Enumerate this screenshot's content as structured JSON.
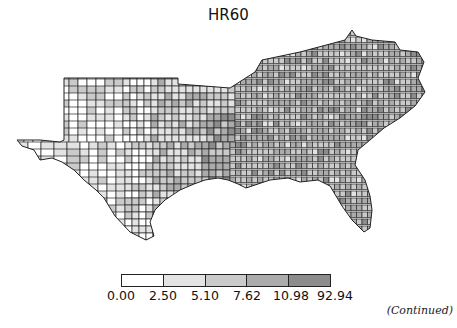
{
  "title": "HR60",
  "map": {
    "region": "Southern United States counties",
    "variable": "HR60",
    "classification": "quantile",
    "region_groups": [
      {
        "name": "texas-west",
        "mean_class": 1
      },
      {
        "name": "texas-east",
        "mean_class": 2
      },
      {
        "name": "oklahoma",
        "mean_class": 1
      },
      {
        "name": "arkansas-louisiana",
        "mean_class": 3
      },
      {
        "name": "mississippi-alabama",
        "mean_class": 3
      },
      {
        "name": "tennessee-kentucky",
        "mean_class": 3
      },
      {
        "name": "georgia-carolinas",
        "mean_class": 3
      },
      {
        "name": "virginia-maryland",
        "mean_class": 3
      },
      {
        "name": "florida",
        "mean_class": 3
      }
    ]
  },
  "legend": {
    "breaks": [
      "0.00",
      "2.50",
      "5.10",
      "7.62",
      "10.98",
      "92.94"
    ],
    "colors": [
      "#ffffff",
      "#e3e3e3",
      "#cacaca",
      "#ababab",
      "#8c8c8c"
    ]
  },
  "footer": {
    "continued": "(Continued)"
  }
}
